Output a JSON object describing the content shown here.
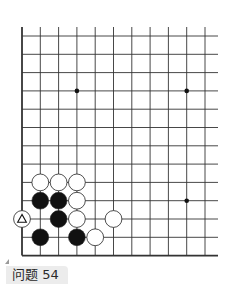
{
  "problem": {
    "label": "问题 54",
    "number": 54
  },
  "board": {
    "visible_columns": 11,
    "visible_rows": 13,
    "left_edge": true,
    "bottom_edge": true,
    "line_color": "#333333",
    "star_points": [
      {
        "col": 3,
        "row": 3
      },
      {
        "col": 9,
        "row": 3
      },
      {
        "col": 9,
        "row": 9
      }
    ],
    "stones": [
      {
        "color": "white",
        "col": 1,
        "row": 8
      },
      {
        "color": "white",
        "col": 2,
        "row": 8
      },
      {
        "color": "white",
        "col": 3,
        "row": 8
      },
      {
        "color": "black",
        "col": 1,
        "row": 9
      },
      {
        "color": "black",
        "col": 2,
        "row": 9
      },
      {
        "color": "white",
        "col": 3,
        "row": 9
      },
      {
        "color": "white",
        "col": 0,
        "row": 10,
        "marker": "triangle"
      },
      {
        "color": "black",
        "col": 2,
        "row": 10
      },
      {
        "color": "white",
        "col": 3,
        "row": 10
      },
      {
        "color": "white",
        "col": 5,
        "row": 10
      },
      {
        "color": "black",
        "col": 1,
        "row": 11
      },
      {
        "color": "black",
        "col": 3,
        "row": 11
      },
      {
        "color": "white",
        "col": 4,
        "row": 11
      }
    ]
  }
}
